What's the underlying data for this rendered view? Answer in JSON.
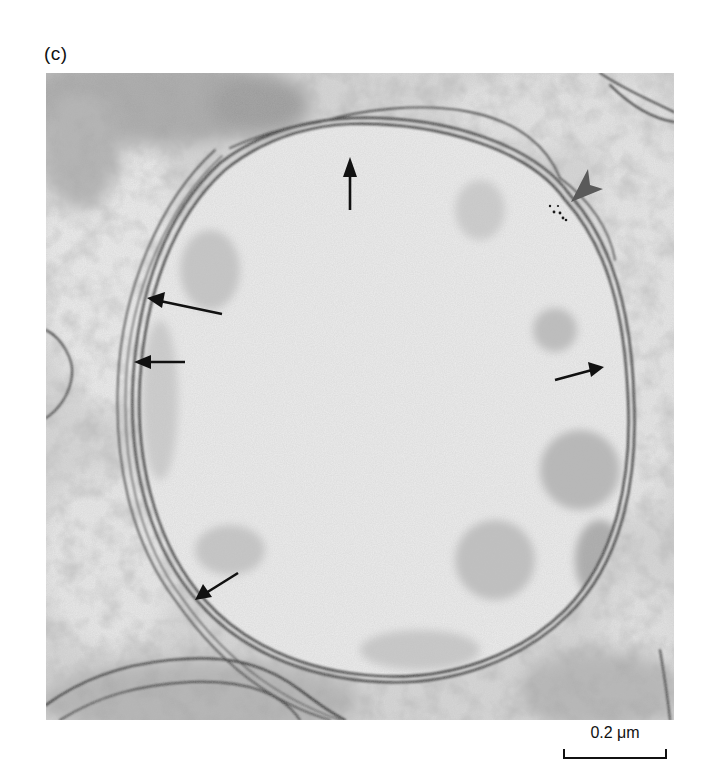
{
  "figure": {
    "panel_label": "(c)",
    "colors": {
      "background": "#ffffff",
      "micrograph_light": "#e9e9e9",
      "micrograph_mid": "#bdbdbd",
      "membrane_dark": "#2a2a2a",
      "arrow": "#111111",
      "arrowhead_marker": "#5a5a5a"
    },
    "annotations": {
      "arrows": [
        {
          "id": "arrow-top",
          "direction": "up",
          "tip": [
            350,
            160
          ],
          "tail": [
            350,
            210
          ]
        },
        {
          "id": "arrow-upper-left",
          "direction": "left",
          "tip": [
            148,
            298
          ],
          "tail": [
            222,
            314
          ]
        },
        {
          "id": "arrow-mid-left",
          "direction": "left",
          "tip": [
            135,
            362
          ],
          "tail": [
            185,
            362
          ]
        },
        {
          "id": "arrow-right",
          "direction": "right",
          "tip": [
            603,
            367
          ],
          "tail": [
            555,
            380
          ]
        },
        {
          "id": "arrow-lower-left",
          "direction": "down-left",
          "tip": [
            195,
            600
          ],
          "tail": [
            238,
            573
          ]
        }
      ],
      "arrowhead_marker": {
        "position": [
          585,
          178
        ],
        "direction": "down-left"
      }
    },
    "scale_bar": {
      "label": "0.2 μm",
      "length_px": 100
    }
  }
}
